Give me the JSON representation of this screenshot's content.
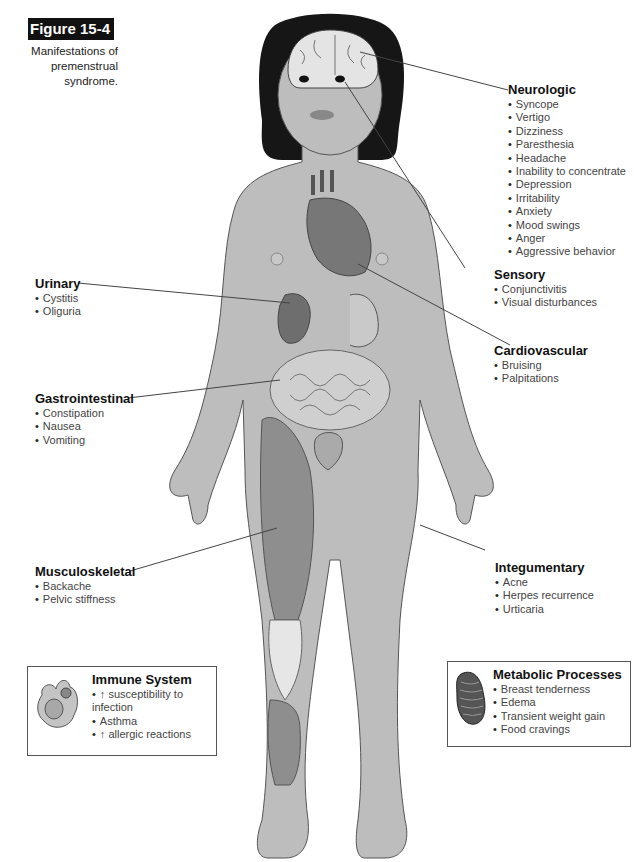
{
  "figure": {
    "label": "Figure 15-4",
    "caption": [
      "Manifestations of",
      "premenstrual syndrome."
    ]
  },
  "groups": {
    "neurologic": {
      "title": "Neurologic",
      "items": [
        "Syncope",
        "Vertigo",
        "Dizziness",
        "Paresthesia",
        "Headache",
        "Inability to concentrate",
        "Depression",
        "Irritability",
        "Anxiety",
        "Mood swings",
        "Anger",
        "Aggressive behavior"
      ]
    },
    "sensory": {
      "title": "Sensory",
      "items": [
        "Conjunctivitis",
        "Visual disturbances"
      ]
    },
    "cardiovascular": {
      "title": "Cardiovascular",
      "items": [
        "Bruising",
        "Palpitations"
      ]
    },
    "urinary": {
      "title": "Urinary",
      "items": [
        "Cystitis",
        "Oliguria"
      ]
    },
    "gastrointestinal": {
      "title": "Gastrointestinal",
      "items": [
        "Constipation",
        "Nausea",
        "Vomiting"
      ]
    },
    "musculoskeletal": {
      "title": "Musculoskeletal",
      "items": [
        "Backache",
        "Pelvic stiffness"
      ]
    },
    "integumentary": {
      "title": "Integumentary",
      "items": [
        "Acne",
        "Herpes recurrence",
        "Urticaria"
      ]
    },
    "immune": {
      "title": "Immune System",
      "items": [
        "↑ susceptibility to infection",
        "Asthma",
        "↑ allergic reactions"
      ]
    },
    "metabolic": {
      "title": "Metabolic Processes",
      "items": [
        "Breast tenderness",
        "Edema",
        "Transient weight gain",
        "Food cravings"
      ]
    }
  },
  "colors": {
    "skin": "#bdbdbd",
    "organ_dark": "#6e6e6e",
    "muscle": "#8e8e8e",
    "hair": "#161616",
    "badge": "#111111"
  }
}
